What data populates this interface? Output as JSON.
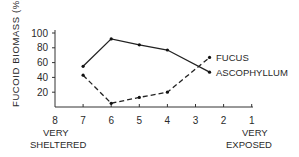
{
  "chart_data": {
    "type": "line",
    "title": "",
    "xlabel": "",
    "ylabel": "FUCOID BIOMASS (%)",
    "x_ticks": [
      "8",
      "7",
      "6",
      "5",
      "4",
      "3",
      "2",
      "1"
    ],
    "x_end_labels": {
      "left": [
        "VERY",
        "SHELTERED"
      ],
      "right": [
        "VERY",
        "EXPOSED"
      ]
    },
    "y_ticks": [
      "100",
      "80",
      "60",
      "40",
      "20"
    ],
    "ylim": [
      0,
      100
    ],
    "xlim": [
      8,
      1
    ],
    "grid": false,
    "legend_position": "inline-right",
    "series": [
      {
        "name": "ASCOPHYLLUM",
        "style": "solid",
        "x": [
          7,
          6,
          5,
          4,
          2.5
        ],
        "values": [
          55,
          92,
          84,
          77,
          47
        ]
      },
      {
        "name": "FUCUS",
        "style": "dashed",
        "x": [
          7,
          6,
          5,
          4,
          2.5
        ],
        "values": [
          43,
          5,
          13,
          20,
          67
        ]
      }
    ]
  },
  "labels": {
    "ylabel": "FUCOID BIOMASS (%)",
    "fucus": "FUCUS",
    "ascophyllum": "ASCOPHYLLUM",
    "left_line1": "VERY",
    "left_line2": "SHELTERED",
    "right_line1": "VERY",
    "right_line2": "EXPOSED"
  }
}
